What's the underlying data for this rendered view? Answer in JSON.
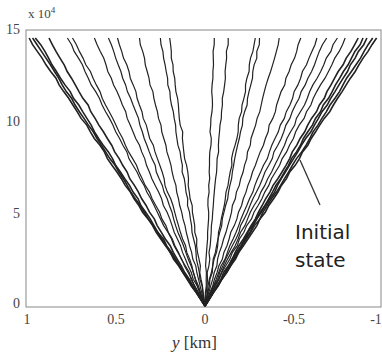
{
  "chart_data": {
    "type": "line",
    "title": "",
    "xlabel_var": "y",
    "xlabel_unit": "[km]",
    "ylabel": "",
    "y_multiplier": "x 10",
    "y_multiplier_exp": "4",
    "xlim": [
      1,
      -1
    ],
    "ylim": [
      0,
      150000
    ],
    "x_ticks": [
      "1",
      "0.5",
      "0",
      "-0.5",
      "-1"
    ],
    "y_ticks": [
      "0",
      "5",
      "10",
      "15"
    ],
    "grid": false,
    "annotation": {
      "line1": "Initial",
      "line2": "state",
      "points_to": "outermost right lines"
    },
    "series_description": "Fan of jagged lines originating at (0,0) spreading to top edge y=15e4",
    "top_endpoints_x": [
      0.99,
      0.97,
      0.95,
      0.88,
      0.77,
      0.74,
      0.62,
      0.54,
      0.49,
      0.37,
      0.25,
      0.2,
      -0.05,
      -0.13,
      -0.28,
      -0.31,
      -0.42,
      -0.54,
      -0.63,
      -0.68,
      -0.74,
      -0.79,
      -0.86,
      -0.89,
      -0.91,
      -0.94,
      -0.96
    ]
  }
}
